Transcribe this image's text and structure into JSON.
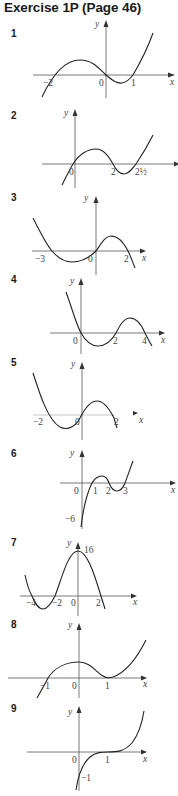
{
  "page": {
    "title": "Exercise 1P (Page 46)"
  },
  "exercises": [
    {
      "number": "1",
      "axis_x_label": "x",
      "axis_y_label": "y",
      "labels": [
        "−2",
        "0",
        "1"
      ],
      "description": "Cubic crossing x-axis at −2, 0 and 1; rising to the right"
    },
    {
      "number": "2",
      "axis_x_label": "",
      "axis_y_label": "y",
      "labels": [
        "0",
        "2",
        "2½"
      ],
      "description": "Cubic crossing x-axis at 0, 2 and 2½; rising to the right"
    },
    {
      "number": "3",
      "axis_x_label": "x",
      "axis_y_label": "y",
      "labels": [
        "−3",
        "0",
        "2"
      ],
      "description": "Negative cubic crossing x-axis at −3, 0 and 2"
    },
    {
      "number": "4",
      "axis_x_label": "x",
      "axis_y_label": "y",
      "labels": [
        "0",
        "2",
        "4"
      ],
      "description": "Negative cubic crossing x-axis at 0, 2 and 4"
    },
    {
      "number": "5",
      "axis_x_label": "x",
      "axis_y_label": "y",
      "labels": [
        "−2",
        "0",
        "2"
      ],
      "description": "Negative cubic crossing x-axis at −2, 0 and 2"
    },
    {
      "number": "6",
      "axis_x_label": "x",
      "axis_y_label": "y",
      "labels": [
        "0",
        "1",
        "2",
        "3",
        "−6"
      ],
      "description": "Cubic crossing x-axis at 1, 2 and 3 with y-intercept −6"
    },
    {
      "number": "7",
      "axis_x_label": "x",
      "axis_y_label": "y",
      "labels": [
        "−4",
        "−2",
        "0",
        "2",
        "16"
      ],
      "description": "Quartic crossing x-axis at −4, −2 and 2 with y-intercept 16"
    },
    {
      "number": "8",
      "axis_x_label": "x",
      "axis_y_label": "y",
      "labels": [
        "−1",
        "0",
        "1"
      ],
      "description": "Cubic crossing at −1, touching x-axis at 1"
    },
    {
      "number": "9",
      "axis_x_label": "x",
      "axis_y_label": "y",
      "labels": [
        "0",
        "1",
        "−1"
      ],
      "description": "Cubic with point of inflection on x-axis at 1, y-intercept −1"
    }
  ]
}
